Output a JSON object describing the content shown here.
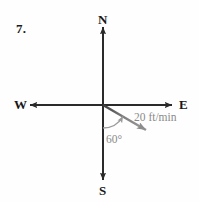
{
  "figure": {
    "problem_number": "7.",
    "type": "vector-compass-diagram",
    "background_color": "#fefefe",
    "axis_color": "#2a2a2a",
    "vector_color": "#8c8c8c",
    "arc_color": "#9a9a9a",
    "label_color": "#171717",
    "annotation_color": "#8a8a8a",
    "compass": {
      "origin": {
        "x": 103,
        "y": 105
      },
      "north_label": "N",
      "south_label": "S",
      "west_label": "W",
      "east_label": "E",
      "north_end_y": 27,
      "south_end_y": 180,
      "west_end_x": 30,
      "east_end_x": 172
    },
    "vector": {
      "magnitude_label": "20 ft/min",
      "tip": {
        "x": 152,
        "y": 134
      },
      "direction_degrees_below_east": 30
    },
    "angle_arc": {
      "label": "60°",
      "value": 60,
      "radius": 23,
      "from_direction": "south",
      "to_direction": "vector"
    }
  }
}
